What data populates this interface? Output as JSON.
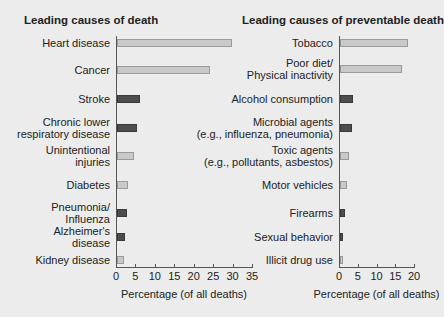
{
  "chart_data": [
    {
      "type": "bar",
      "orientation": "horizontal",
      "title": "Leading causes of death",
      "xlabel": "Percentage (of all deaths)",
      "ylabel": "",
      "xlim": [
        0,
        35
      ],
      "xticks": [
        "0",
        "5",
        "10",
        "15",
        "20",
        "25",
        "30",
        "35"
      ],
      "grid": false,
      "categories": [
        "Heart disease",
        "Cancer",
        "Stroke",
        "Chronic lower\nrespiratory disease",
        "Unintentional\ninjuries",
        "Diabetes",
        "Pneumonia/\nInfluenza",
        "Alzheimer's\ndisease",
        "Kidney disease"
      ],
      "values": [
        29.6,
        23.9,
        5.9,
        5.2,
        4.3,
        2.9,
        2.7,
        2.1,
        1.8
      ],
      "shades": [
        "light",
        "light",
        "dark",
        "dark",
        "light",
        "light",
        "dark",
        "dark",
        "light"
      ]
    },
    {
      "type": "bar",
      "orientation": "horizontal",
      "title": "Leading causes of preventable death",
      "xlabel": "Percentage (of all deaths)",
      "ylabel": "",
      "xlim": [
        0,
        20
      ],
      "xticks": [
        "0",
        "5",
        "10",
        "15",
        "20"
      ],
      "grid": false,
      "categories": [
        "Tobacco",
        "Poor diet/\nPhysical inactivity",
        "Alcohol consumption",
        "Microbial agents\n(e.g., influenza, pneumonia)",
        "Toxic agents\n(e.g., pollutants, asbestos)",
        "Motor vehicles",
        "Firearms",
        "Sexual behavior",
        "Illicit drug use"
      ],
      "values": [
        18.1,
        16.6,
        3.5,
        3.1,
        2.3,
        1.8,
        1.2,
        0.8,
        0.7
      ],
      "shades": [
        "light",
        "light",
        "dark",
        "dark",
        "light",
        "light",
        "dark",
        "dark",
        "light"
      ]
    }
  ],
  "colors": {
    "light_bar": "#c9c9c9",
    "dark_bar": "#4d4d4d",
    "background": "#ececec"
  }
}
